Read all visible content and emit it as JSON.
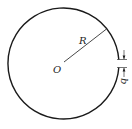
{
  "diagram": {
    "type": "split-ring",
    "labels": {
      "center": "O",
      "radius": "R",
      "gap": "b"
    },
    "colors": {
      "stroke": "#1a1a1a",
      "background": "#ffffff"
    }
  }
}
